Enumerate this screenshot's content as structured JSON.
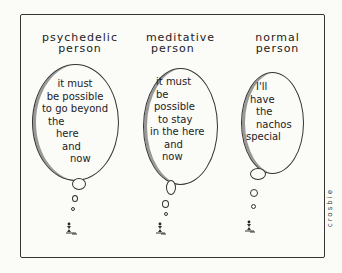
{
  "panels": [
    {
      "label": [
        "psychedelic",
        "person"
      ],
      "thought": [
        "it must",
        "be possible",
        "to go beyond",
        "the",
        "here",
        "and",
        "now"
      ]
    },
    {
      "label": [
        "meditative",
        "person"
      ],
      "thought": [
        "it must",
        "be",
        "possible",
        "to stay",
        "in the here",
        "and",
        "now"
      ]
    },
    {
      "label": [
        "normal",
        "person"
      ],
      "thought": [
        "I'll",
        "have",
        "the",
        "nachos",
        "special"
      ]
    }
  ],
  "signature": "crosbie"
}
